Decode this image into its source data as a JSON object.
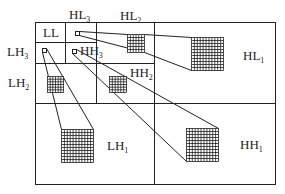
{
  "subbands": {
    "LL": {
      "base": "LL",
      "sub": ""
    },
    "HL3": {
      "base": "HL",
      "sub": "3"
    },
    "HL2": {
      "base": "HL",
      "sub": "2"
    },
    "HL1": {
      "base": "HL",
      "sub": "1"
    },
    "LH3": {
      "base": "LH",
      "sub": "3"
    },
    "LH2": {
      "base": "LH",
      "sub": "2"
    },
    "LH1": {
      "base": "LH",
      "sub": "1"
    },
    "HH3": {
      "base": "HH",
      "sub": "3"
    },
    "HH2": {
      "base": "HH",
      "sub": "2"
    },
    "HH1": {
      "base": "HH",
      "sub": "1"
    }
  },
  "colors": {
    "stroke": "#222222",
    "background": "#ffffff"
  }
}
